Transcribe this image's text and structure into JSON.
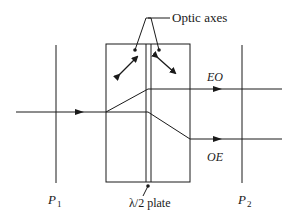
{
  "diagram": {
    "labels": {
      "optic_axes": "Optic axes",
      "eo": "EO",
      "oe": "OE",
      "p1_main": "P",
      "p1_sub": "1",
      "p2_main": "P",
      "p2_sub": "2",
      "half_wave_plate": "λ/2 plate"
    },
    "colors": {
      "stroke": "#1a1a1a",
      "background": "#ffffff"
    },
    "components": [
      {
        "id": "P1",
        "type": "polarizer",
        "x": 56
      },
      {
        "id": "crystal-1",
        "type": "birefringent-crystal",
        "optic_axis": "down-left to up-right"
      },
      {
        "id": "half-wave-plate",
        "type": "waveplate",
        "label": "λ/2 plate"
      },
      {
        "id": "crystal-2",
        "type": "birefringent-crystal",
        "optic_axis": "up-left to down-right"
      },
      {
        "id": "P2",
        "type": "polarizer",
        "x": 242
      }
    ],
    "beams": [
      {
        "name": "input",
        "direction": "right"
      },
      {
        "name": "EO",
        "position": "upper output"
      },
      {
        "name": "OE",
        "position": "lower output"
      }
    ]
  }
}
